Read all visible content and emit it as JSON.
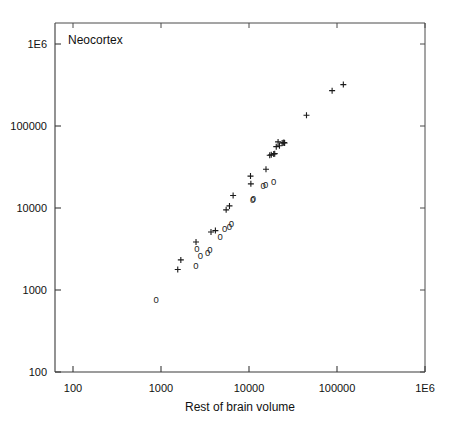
{
  "chart_data": {
    "type": "scatter",
    "title": "",
    "plot_label": "Neocortex",
    "xlabel": "Rest of brain volume",
    "ylabel": "",
    "xscale": "log",
    "yscale": "log",
    "xlim": [
      100,
      1000000
    ],
    "ylim": [
      100,
      1000000
    ],
    "grid": false,
    "legend": "none",
    "xticks": [
      100,
      1000,
      10000,
      100000,
      1000000
    ],
    "xticklabels": [
      "100",
      "1000",
      "10000",
      "100000",
      "1E6"
    ],
    "yticks": [
      100,
      1000,
      10000,
      100000,
      1000000
    ],
    "yticklabels": [
      "100",
      "1000",
      "10000",
      "100000",
      "1E6"
    ],
    "series": [
      {
        "name": "cross-group",
        "marker": "plus",
        "points": [
          [
            1550,
            1780
          ],
          [
            1680,
            2330
          ],
          [
            2500,
            3850
          ],
          [
            3700,
            5100
          ],
          [
            4150,
            5300
          ],
          [
            5500,
            9500
          ],
          [
            6000,
            10600
          ],
          [
            6600,
            14200
          ],
          [
            10400,
            24500
          ],
          [
            10500,
            19700
          ],
          [
            15600,
            29700
          ],
          [
            17200,
            44000
          ],
          [
            17900,
            44500
          ],
          [
            19100,
            45500
          ],
          [
            19600,
            46000
          ],
          [
            20400,
            56000
          ],
          [
            21400,
            64000
          ],
          [
            22200,
            57500
          ],
          [
            23800,
            62000
          ],
          [
            24500,
            62500
          ],
          [
            25000,
            63000
          ],
          [
            25400,
            62000
          ],
          [
            45000,
            135000
          ],
          [
            88000,
            270000
          ],
          [
            118000,
            320000
          ]
        ]
      },
      {
        "name": "zero-group",
        "marker": "zero",
        "points": [
          [
            880,
            760
          ],
          [
            2500,
            1950
          ],
          [
            2550,
            3200
          ],
          [
            2800,
            2600
          ],
          [
            3400,
            2850
          ],
          [
            3600,
            3050
          ],
          [
            4700,
            4400
          ],
          [
            5300,
            5500
          ],
          [
            6000,
            5900
          ],
          [
            6300,
            6400
          ],
          [
            11000,
            12400
          ],
          [
            11200,
            12900
          ],
          [
            14500,
            18600
          ],
          [
            15500,
            19000
          ],
          [
            19000,
            21000
          ]
        ]
      }
    ]
  },
  "axes": {
    "x_title": "Rest of brain volume",
    "in_plot_label": "Neocortex"
  },
  "colors": {
    "background": "#ffffff",
    "axis": "#3a3a3a",
    "frame": "#4a4a4a",
    "marker": "#1a1a1a",
    "text": "#111111"
  }
}
